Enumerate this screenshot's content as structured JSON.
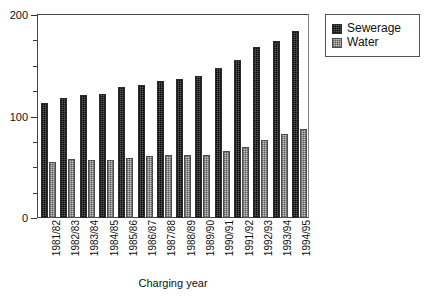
{
  "chart_data": {
    "type": "bar",
    "title": "",
    "xlabel": "Charging year",
    "ylabel": "",
    "ylim": [
      0,
      200
    ],
    "ytick_major": [
      0,
      100,
      200
    ],
    "ytick_minor_step": 25,
    "grid": false,
    "legend_position": "top-right",
    "categories": [
      "1981/82",
      "1982/83",
      "1983/84",
      "1984/85",
      "1985/86",
      "1986/87",
      "1987/88",
      "1988/89",
      "1989/90",
      "1990/91",
      "1991/92",
      "1992/93",
      "1993/94",
      "1994/95"
    ],
    "series": [
      {
        "name": "Sewerage",
        "color": "#5b5b5b",
        "values": [
          113,
          118,
          121,
          122,
          129,
          131,
          135,
          137,
          140,
          148,
          156,
          168,
          174,
          184
        ]
      },
      {
        "name": "Water",
        "color": "#c4c4c4",
        "values": [
          55,
          58,
          57,
          57,
          59,
          61,
          62,
          62,
          62,
          66,
          70,
          77,
          83,
          88
        ]
      }
    ]
  },
  "axis": {
    "y_labels": [
      "200",
      "100",
      "0"
    ]
  },
  "legend": {
    "items": [
      {
        "label": "Sewerage",
        "swatch": "sewerage-swatch"
      },
      {
        "label": "Water",
        "swatch": "water-swatch"
      }
    ]
  }
}
